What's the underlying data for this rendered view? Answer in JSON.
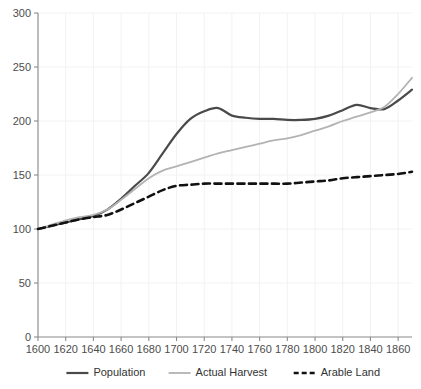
{
  "chart_data": {
    "type": "line",
    "title": "",
    "subtitle": "",
    "xlabel": "",
    "ylabel": "",
    "xlim": [
      1600,
      1870
    ],
    "ylim": [
      0,
      300
    ],
    "grid": true,
    "legend_position": "bottom",
    "x_ticks": [
      1600,
      1620,
      1640,
      1660,
      1680,
      1700,
      1720,
      1740,
      1760,
      1780,
      1800,
      1820,
      1840,
      1860
    ],
    "y_ticks": [
      0,
      50,
      100,
      150,
      200,
      250,
      300
    ],
    "x": [
      1600,
      1610,
      1620,
      1630,
      1640,
      1650,
      1660,
      1670,
      1680,
      1690,
      1700,
      1710,
      1720,
      1730,
      1740,
      1750,
      1760,
      1770,
      1780,
      1790,
      1800,
      1810,
      1820,
      1830,
      1840,
      1850,
      1860,
      1870
    ],
    "series": [
      {
        "name": "Population",
        "color": "#4a4a4a",
        "style": "solid",
        "width": 2.2,
        "values": [
          100,
          103,
          106,
          109,
          112,
          118,
          128,
          140,
          152,
          170,
          188,
          202,
          209,
          212,
          205,
          203,
          202,
          202,
          201,
          201,
          202,
          205,
          210,
          215,
          212,
          211,
          219,
          229
        ]
      },
      {
        "name": "Actual Harvest",
        "color": "#b3b3b3",
        "style": "solid",
        "width": 1.8,
        "values": [
          100,
          104,
          108,
          111,
          113,
          118,
          127,
          137,
          147,
          154,
          158,
          162,
          166,
          170,
          173,
          176,
          179,
          182,
          184,
          187,
          191,
          195,
          200,
          204,
          208,
          213,
          225,
          240
        ]
      },
      {
        "name": "Arable Land",
        "color": "#111111",
        "style": "dashed",
        "width": 2.6,
        "values": [
          100,
          103,
          106,
          109,
          111,
          113,
          118,
          124,
          130,
          136,
          140,
          141,
          142,
          142,
          142,
          142,
          142,
          142,
          142,
          143,
          144,
          145,
          147,
          148,
          149,
          150,
          151,
          153
        ]
      }
    ]
  },
  "legend": {
    "items": [
      {
        "label": "Population"
      },
      {
        "label": "Actual Harvest"
      },
      {
        "label": "Arable Land"
      }
    ]
  },
  "axis_colors": {
    "axis_line": "#8a8a8a",
    "grid_line": "#f2f2f2",
    "tick_label": "#4d4d4d"
  }
}
